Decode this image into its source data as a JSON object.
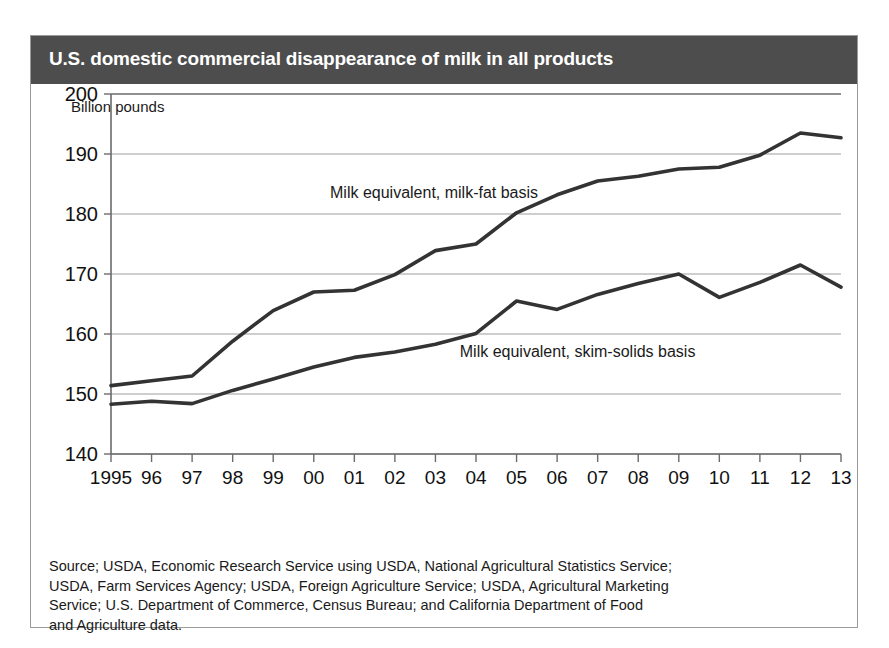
{
  "header": {
    "title": "U.S. domestic commercial disappearance of milk in all products",
    "band_color": "#4d4d4d",
    "title_color": "#ffffff"
  },
  "axis_unit_label": "Billion pounds",
  "source_note": {
    "line1": "Source; USDA, Economic Research Service using USDA, National Agricultural Statistics Service;",
    "line2": "USDA, Farm Services Agency; USDA, Foreign Agriculture Service; USDA, Agricultural Marketing",
    "line3": "Service; U.S. Department of Commerce, Census Bureau; and California Department of Food",
    "line4": "and Agriculture data."
  },
  "chart_data": {
    "type": "line",
    "title": "U.S. domestic commercial disappearance of milk in all products",
    "xlabel": "",
    "ylabel": "Billion pounds",
    "ylim": [
      140,
      200
    ],
    "yticks": [
      140,
      150,
      160,
      170,
      180,
      190,
      200
    ],
    "ytick_labels": [
      "140",
      "150",
      "160",
      "170",
      "180",
      "190",
      "200"
    ],
    "grid": true,
    "legend_position": "inline-annotation",
    "categories": [
      1995,
      1996,
      1997,
      1998,
      1999,
      2000,
      2001,
      2002,
      2003,
      2004,
      2005,
      2006,
      2007,
      2008,
      2009,
      2010,
      2011,
      2012,
      2013
    ],
    "xtick_labels": [
      "1995",
      "96",
      "97",
      "98",
      "99",
      "00",
      "01",
      "02",
      "03",
      "04",
      "05",
      "06",
      "07",
      "08",
      "09",
      "10",
      "11",
      "12",
      "13"
    ],
    "series": [
      {
        "name": "Milk equivalent, milk-fat basis",
        "color": "#333333",
        "label_x_year": 2000.4,
        "label_y_value": 182.6,
        "values": [
          151.4,
          152.2,
          153.0,
          158.8,
          163.9,
          167.0,
          167.3,
          169.9,
          173.9,
          175.0,
          180.2,
          183.2,
          185.5,
          186.3,
          187.5,
          187.8,
          189.8,
          193.5,
          192.7
        ]
      },
      {
        "name": "Milk equivalent, skim-solids basis",
        "color": "#333333",
        "label_x_year": 2003.6,
        "label_y_value": 156.2,
        "values": [
          148.3,
          148.8,
          148.4,
          150.6,
          152.5,
          154.5,
          156.1,
          157.0,
          158.3,
          160.1,
          165.5,
          164.1,
          166.6,
          168.4,
          170.0,
          166.1,
          168.6,
          171.5,
          167.8
        ]
      }
    ]
  }
}
